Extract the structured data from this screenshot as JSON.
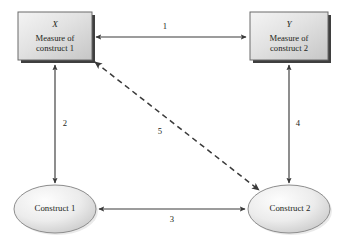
{
  "diagram": {
    "colors": {
      "stroke": "#3a3a3a",
      "text": "#231f20",
      "box_fill_light": "#f2f2f2",
      "box_fill_dark": "#c9c9c9",
      "box_shadow": "#3a3a3a",
      "ellipse_fill_light": "#fbfbfb",
      "ellipse_fill_dark": "#cfcfcf",
      "background": "#ffffff"
    },
    "nodes": [
      {
        "id": "measure-x",
        "shape": "rectangle",
        "variable": "X",
        "line1": "Measure of",
        "line2": "construct 1"
      },
      {
        "id": "measure-y",
        "shape": "rectangle",
        "variable": "Y",
        "line1": "Measure of",
        "line2": "construct 2"
      },
      {
        "id": "construct-1",
        "shape": "ellipse",
        "label": "Construct 1"
      },
      {
        "id": "construct-2",
        "shape": "ellipse",
        "label": "Construct 2"
      }
    ],
    "edges": [
      {
        "id": "edge-1",
        "label": "1",
        "from": "measure-x",
        "to": "measure-y",
        "style": "solid",
        "arrows": "both"
      },
      {
        "id": "edge-2",
        "label": "2",
        "from": "measure-x",
        "to": "construct-1",
        "style": "solid",
        "arrows": "both"
      },
      {
        "id": "edge-3",
        "label": "3",
        "from": "construct-1",
        "to": "construct-2",
        "style": "solid",
        "arrows": "both"
      },
      {
        "id": "edge-4",
        "label": "4",
        "from": "measure-y",
        "to": "construct-2",
        "style": "solid",
        "arrows": "both"
      },
      {
        "id": "edge-5",
        "label": "5",
        "from": "measure-x",
        "to": "construct-2",
        "style": "dashed",
        "arrows": "both"
      }
    ]
  }
}
